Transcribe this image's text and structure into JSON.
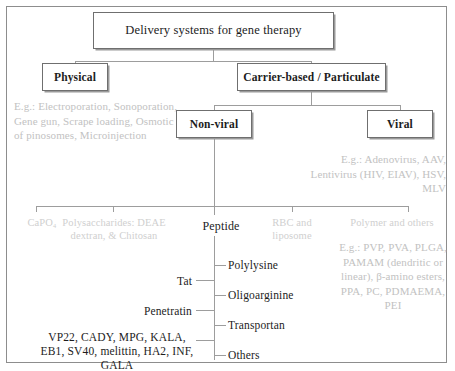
{
  "diagram": {
    "title": "Delivery systems for gene therapy",
    "frame_color": "#8d8d8d",
    "box_text_color": "#1c1c1c",
    "grey_text_color": "#c2c2c2",
    "line_color": "#9d9d9d",
    "nodes": {
      "root": "Delivery systems for gene therapy",
      "physical": "Physical",
      "carrier": "Carrier-based / Particulate",
      "nonviral": "Non-viral",
      "viral": "Viral"
    },
    "examples": {
      "physical": "E.g.: Electroporation, Sonoporation, Gene gun, Scrape loading, Osmotic lysis of pinosomes, Microinjection",
      "viral": "E.g.: Adenovirus, AAV, Lentivirus (HIV, EIAV), HSV, MLV",
      "polymer": "E.g.: PVP, PVA, PLGA, PAMAM (dendritic or linear), β-amino esters, PPA, PC, PDMAEMA, PEI"
    },
    "nonviral_categories": {
      "capo4": "CaPO₄",
      "polysaccharides": "Polysaccharides: DEAE dextran, & Chitosan",
      "peptide": "Peptide",
      "rbc_liposome": "RBC and liposome",
      "polymer_others": "Polymer and others"
    },
    "peptide_children": {
      "polylysine": "Polylysine",
      "oligoarginine": "Oligoarginine",
      "transportan": "Transportan",
      "others": "Others"
    },
    "peptide_left_labels": {
      "tat": "Tat",
      "penetratin": "Penetratin",
      "others_list": "VP22, CADY, MPG, KALA, EB1, SV40, melittin, HA2, INF, GALA"
    }
  }
}
